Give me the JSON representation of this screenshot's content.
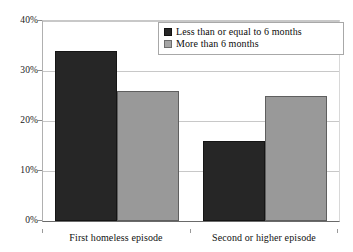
{
  "chart_data": {
    "type": "bar",
    "title": "",
    "subtitle": "",
    "xlabel": "",
    "ylabel": "",
    "categories": [
      "First homeless episode",
      "Second or higher episode"
    ],
    "series": [
      {
        "name": "Less than or equal to 6 months",
        "color": "#262626",
        "values": [
          34,
          16
        ]
      },
      {
        "name": "More than 6 months",
        "color": "#999999",
        "values": [
          26,
          25
        ]
      }
    ],
    "ylim": [
      0,
      40
    ],
    "ytick_values": [
      0,
      10,
      20,
      30,
      40
    ],
    "ytick_labels": [
      "0%",
      "10%",
      "20%",
      "30%",
      "40%"
    ],
    "grid": true,
    "legend_position": "top-right",
    "annotations": []
  },
  "legend": {
    "entries": [
      {
        "label": "Less than or equal to 6 months"
      },
      {
        "label": "More than 6 months"
      }
    ]
  },
  "colors": {
    "series0": "#262626",
    "series1": "#999999",
    "gridline": "#c8c8c8",
    "axis": "#6a6a6a",
    "background": "#ffffff",
    "text": "#111111"
  }
}
